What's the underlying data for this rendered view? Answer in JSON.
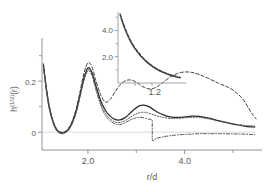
{
  "figure": {
    "name": "pair-correlation-plot"
  },
  "chart_data": {
    "type": "line",
    "title": "",
    "xlabel": "r/d",
    "ylabel": "h^(1/2)(r)",
    "xlim": [
      1.05,
      5.6
    ],
    "ylim": [
      -0.07,
      0.33
    ],
    "xticks": [
      2.0,
      4.0
    ],
    "xticklabels": [
      "2.0",
      "4.0"
    ],
    "yticks": [
      0,
      0.2
    ],
    "yticklabels": [
      "0",
      "0.2"
    ],
    "grid": false,
    "legend": "none",
    "zero_line": 0,
    "series": [
      {
        "name": "solid",
        "style": "solid",
        "color": "#2b2b2b",
        "x": [
          1.08,
          1.14,
          1.2,
          1.28,
          1.36,
          1.44,
          1.52,
          1.6,
          1.68,
          1.76,
          1.84,
          1.92,
          2.0,
          2.08,
          2.16,
          2.26,
          2.36,
          2.46,
          2.56,
          2.66,
          2.76,
          2.86,
          2.96,
          3.06,
          3.16,
          3.26,
          3.36,
          3.46,
          3.56,
          3.7,
          3.85,
          4.0,
          4.15,
          4.3,
          4.5,
          4.7,
          4.9,
          5.1,
          5.3,
          5.45
        ],
        "y": [
          0.262,
          0.17,
          0.098,
          0.04,
          0.008,
          -0.002,
          0.0,
          0.012,
          0.04,
          0.086,
          0.15,
          0.215,
          0.252,
          0.236,
          0.185,
          0.125,
          0.086,
          0.063,
          0.05,
          0.048,
          0.056,
          0.072,
          0.09,
          0.103,
          0.106,
          0.1,
          0.088,
          0.076,
          0.068,
          0.06,
          0.058,
          0.06,
          0.063,
          0.062,
          0.055,
          0.045,
          0.036,
          0.028,
          0.022,
          0.02
        ]
      },
      {
        "name": "dashed-upper",
        "style": "dashed",
        "color": "#3a3a3a",
        "x": [
          1.08,
          1.14,
          1.2,
          1.28,
          1.36,
          1.44,
          1.52,
          1.6,
          1.68,
          1.76,
          1.84,
          1.92,
          2.0,
          2.08,
          2.16,
          2.26,
          2.36,
          2.46,
          2.56,
          2.66,
          2.76,
          2.86,
          2.96,
          3.06,
          3.16,
          3.26,
          3.36,
          3.46,
          3.56,
          3.7,
          3.85,
          4.0,
          4.15,
          4.3,
          4.5,
          4.7,
          4.9,
          5.05,
          5.2,
          5.32,
          5.4,
          5.48
        ],
        "y": [
          0.268,
          0.176,
          0.104,
          0.044,
          0.01,
          0.0,
          0.002,
          0.016,
          0.046,
          0.094,
          0.162,
          0.232,
          0.272,
          0.258,
          0.205,
          0.148,
          0.118,
          0.128,
          0.158,
          0.185,
          0.2,
          0.205,
          0.2,
          0.188,
          0.176,
          0.17,
          0.172,
          0.182,
          0.196,
          0.216,
          0.23,
          0.236,
          0.234,
          0.226,
          0.21,
          0.192,
          0.176,
          0.158,
          0.13,
          0.095,
          0.07,
          0.052
        ]
      },
      {
        "name": "dotted-middle",
        "style": "dotted",
        "color": "#4a4a4a",
        "x": [
          1.08,
          1.14,
          1.2,
          1.28,
          1.36,
          1.44,
          1.52,
          1.6,
          1.68,
          1.76,
          1.84,
          1.92,
          2.0,
          2.08,
          2.16,
          2.26,
          2.36,
          2.46,
          2.56,
          2.66,
          2.76,
          2.86,
          2.96,
          3.06,
          3.16,
          3.26,
          3.36,
          3.46,
          3.56,
          3.7,
          3.85,
          4.0,
          4.15,
          4.3,
          4.5,
          4.7,
          4.9,
          5.1,
          5.3,
          5.45
        ],
        "y": [
          0.258,
          0.166,
          0.094,
          0.038,
          0.006,
          -0.004,
          -0.002,
          0.01,
          0.038,
          0.082,
          0.144,
          0.208,
          0.244,
          0.228,
          0.176,
          0.114,
          0.074,
          0.052,
          0.04,
          0.038,
          0.044,
          0.056,
          0.068,
          0.076,
          0.078,
          0.074,
          0.068,
          0.062,
          0.058,
          0.054,
          0.054,
          0.056,
          0.058,
          0.058,
          0.052,
          0.044,
          0.036,
          0.03,
          0.026,
          0.024
        ]
      },
      {
        "name": "dashed-lower",
        "style": "dashdot",
        "color": "#555555",
        "x": [
          1.08,
          1.14,
          1.2,
          1.28,
          1.36,
          1.44,
          1.52,
          1.6,
          1.68,
          1.76,
          1.84,
          1.92,
          2.0,
          2.08,
          2.16,
          2.26,
          2.36,
          2.46,
          2.56,
          2.66,
          2.76,
          2.86,
          2.96,
          3.06,
          3.16,
          3.26,
          3.33,
          3.33,
          3.42,
          3.56,
          3.7,
          3.9,
          4.1,
          4.3,
          4.5,
          4.75,
          5.0,
          5.25,
          5.45
        ],
        "y": [
          0.255,
          0.163,
          0.092,
          0.036,
          0.004,
          -0.006,
          -0.004,
          0.008,
          0.035,
          0.078,
          0.14,
          0.204,
          0.24,
          0.224,
          0.17,
          0.108,
          0.066,
          0.044,
          0.032,
          0.03,
          0.036,
          0.046,
          0.054,
          0.058,
          0.056,
          0.05,
          0.044,
          -0.03,
          -0.024,
          -0.018,
          -0.014,
          -0.01,
          -0.008,
          -0.006,
          -0.006,
          -0.006,
          -0.007,
          -0.008,
          -0.01
        ]
      }
    ]
  },
  "inset": {
    "xlabel": "1.2",
    "xticklabels": [
      "1.2"
    ],
    "yticks": [
      2.0,
      4.0
    ],
    "yticklabels": [
      "4.0",
      "2.0"
    ],
    "xlim": [
      1.0,
      1.48
    ],
    "ylim": [
      0.0,
      5.4
    ],
    "series": [
      {
        "name": "inset-solid",
        "style": "solid",
        "color": "#2b2b2b",
        "x": [
          1.015,
          1.03,
          1.05,
          1.07,
          1.09,
          1.12,
          1.15,
          1.18,
          1.21,
          1.25,
          1.29,
          1.33,
          1.37,
          1.41,
          1.44
        ],
        "y": [
          5.2,
          4.7,
          4.1,
          3.6,
          3.15,
          2.62,
          2.2,
          1.84,
          1.54,
          1.22,
          0.96,
          0.76,
          0.6,
          0.48,
          0.4
        ]
      },
      {
        "name": "inset-dashed",
        "style": "dashed",
        "color": "#3a3a3a",
        "x": [
          1.015,
          1.03,
          1.05,
          1.07,
          1.09,
          1.12,
          1.15,
          1.18,
          1.21,
          1.25,
          1.29,
          1.33,
          1.37,
          1.41,
          1.44
        ],
        "y": [
          5.28,
          4.8,
          4.2,
          3.7,
          3.24,
          2.7,
          2.28,
          1.9,
          1.6,
          1.26,
          1.0,
          0.8,
          0.64,
          0.52,
          0.44
        ]
      },
      {
        "name": "inset-dotted",
        "style": "dotted",
        "color": "#4a4a4a",
        "x": [
          1.015,
          1.03,
          1.05,
          1.07,
          1.09,
          1.12,
          1.15,
          1.18,
          1.21,
          1.25,
          1.29,
          1.33,
          1.37,
          1.41,
          1.44
        ],
        "y": [
          5.12,
          4.62,
          4.02,
          3.52,
          3.08,
          2.55,
          2.14,
          1.78,
          1.48,
          1.17,
          0.92,
          0.72,
          0.57,
          0.45,
          0.37
        ]
      }
    ]
  }
}
